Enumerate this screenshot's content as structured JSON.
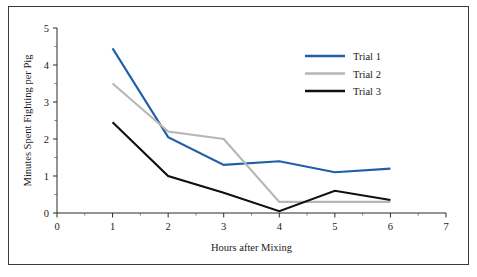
{
  "chart_data": {
    "type": "line",
    "title": "",
    "xlabel": "Hours after Mixing",
    "ylabel": "Minutes Spent Fighting per Pig",
    "x": [
      1,
      2,
      3,
      4,
      5,
      6
    ],
    "xlim": [
      0,
      7
    ],
    "ylim": [
      0,
      5
    ],
    "xticks": [
      0,
      1,
      2,
      3,
      4,
      5,
      6,
      7
    ],
    "yticks": [
      0,
      1,
      2,
      3,
      4,
      5
    ],
    "xtick_labels": [
      "0",
      "1",
      "2",
      "3",
      "4",
      "5",
      "6",
      "7"
    ],
    "ytick_labels": [
      "0",
      "1",
      "2",
      "3",
      "4",
      "5"
    ],
    "minor_ticks": true,
    "grid": false,
    "legend_position": "upper right",
    "series": [
      {
        "name": "Trial 1",
        "color": "#1f5ea8",
        "values": [
          4.45,
          2.05,
          1.3,
          1.4,
          1.1,
          1.2
        ]
      },
      {
        "name": "Trial 2",
        "color": "#b6b6b6",
        "values": [
          3.5,
          2.2,
          2.0,
          0.3,
          0.3,
          0.3
        ]
      },
      {
        "name": "Trial 3",
        "color": "#101010",
        "values": [
          2.45,
          1.0,
          0.55,
          0.05,
          0.6,
          0.35
        ]
      }
    ]
  },
  "legend": {
    "items": [
      {
        "label": "Trial 1"
      },
      {
        "label": "Trial 2"
      },
      {
        "label": "Trial 3"
      }
    ]
  },
  "axes": {
    "x_title": "Hours after Mixing",
    "y_title": "Minutes Spent Fighting per Pig"
  },
  "colors": {
    "trial1": "#1f5ea8",
    "trial2": "#b6b6b6",
    "trial3": "#101010",
    "frame": "#3a3a3a",
    "axis": "#2a2a2a",
    "background": "#ffffff"
  }
}
